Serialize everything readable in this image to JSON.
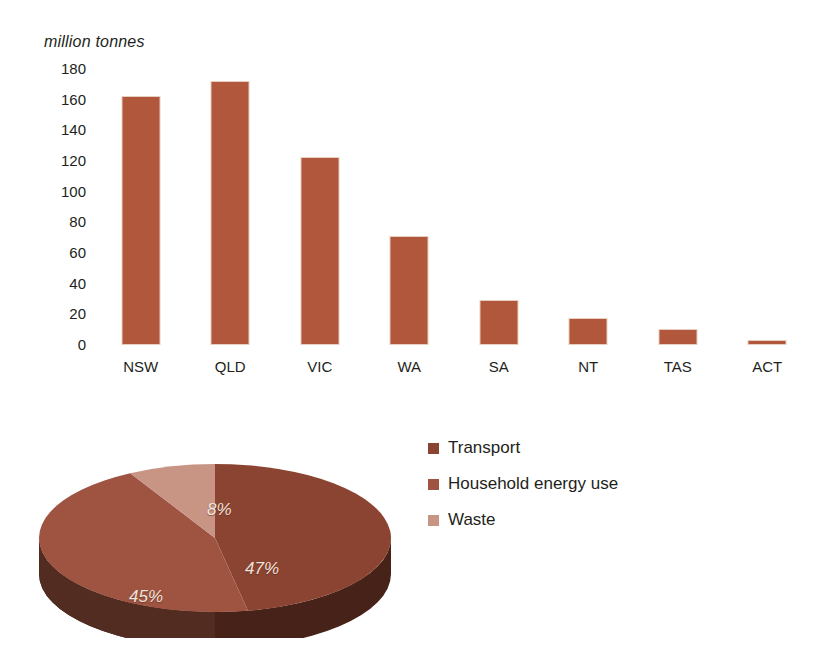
{
  "chart_data": [
    {
      "type": "bar",
      "title": "",
      "ylabel": "million tonnes",
      "xlabel": "",
      "categories": [
        "NSW",
        "QLD",
        "VIC",
        "WA",
        "SA",
        "NT",
        "TAS",
        "ACT"
      ],
      "values": [
        161,
        171,
        121,
        70,
        28,
        16,
        9,
        1
      ],
      "yticks": [
        0,
        20,
        40,
        60,
        80,
        100,
        120,
        140,
        160,
        180
      ],
      "ylim": [
        0,
        180
      ],
      "grid": false,
      "legend": "none",
      "bar_color": "#b0573c"
    },
    {
      "type": "pie",
      "title": "",
      "labels": [
        "Transport",
        "Household energy use",
        "Waste"
      ],
      "values": [
        47,
        45,
        8
      ],
      "value_labels": [
        "47%",
        "45%",
        "8%"
      ],
      "colors": [
        "#8c4432",
        "#9e5440",
        "#c89484"
      ],
      "legend": "right",
      "three_d": true
    }
  ],
  "bar_chart": {
    "axis_title": "million tonnes",
    "ticks": [
      {
        "label": "180"
      },
      {
        "label": "160"
      },
      {
        "label": "140"
      },
      {
        "label": "120"
      },
      {
        "label": "100"
      },
      {
        "label": "80"
      },
      {
        "label": "60"
      },
      {
        "label": "40"
      },
      {
        "label": "20"
      },
      {
        "label": "0"
      }
    ],
    "bars": [
      {
        "label": "NSW",
        "value": 161
      },
      {
        "label": "QLD",
        "value": 171
      },
      {
        "label": "VIC",
        "value": 121
      },
      {
        "label": "WA",
        "value": 70
      },
      {
        "label": "SA",
        "value": 28
      },
      {
        "label": "NT",
        "value": 16
      },
      {
        "label": "TAS",
        "value": 9
      },
      {
        "label": "ACT",
        "value": 1
      }
    ]
  },
  "pie_chart": {
    "slices": [
      {
        "label": "Transport",
        "value": 47,
        "pct_label": "47%",
        "color": "#8c4432"
      },
      {
        "label": "Household energy use",
        "value": 45,
        "pct_label": "45%",
        "color": "#9e5440"
      },
      {
        "label": "Waste",
        "value": 8,
        "pct_label": "8%",
        "color": "#c89484"
      }
    ]
  }
}
